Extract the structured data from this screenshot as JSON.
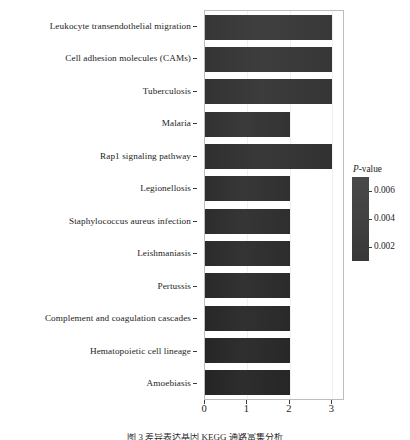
{
  "chart_data": {
    "type": "bar",
    "orientation": "horizontal",
    "title": "",
    "xlabel": "",
    "ylabel": "",
    "xlim": [
      0,
      3.25
    ],
    "xticks": [
      0,
      1,
      2,
      3
    ],
    "xtick_labels": [
      "0",
      "1",
      "2",
      "3"
    ],
    "grid": true,
    "grid_axis": "x",
    "bar_color": "#3e3e3e",
    "categories": [
      "Leukocyte transendothelial migration",
      "Cell adhesion molecules (CAMs)",
      "Tuberculosis",
      "Malaria",
      "Rap1 signaling pathway",
      "Legionellosis",
      "Staphylococcus aureus infection",
      "Leishmaniasis",
      "Pertussis",
      "Complement and coagulation cascades",
      "Hematopoietic cell lineage",
      "Amoebiasis"
    ],
    "values": [
      3,
      3,
      3,
      2,
      3,
      2,
      2,
      2,
      2,
      2,
      2,
      2
    ],
    "legend": {
      "position": "right",
      "title": "P-value",
      "title_italic_prefix": "P",
      "title_rest": "-value",
      "type": "colorbar",
      "ticks": [
        0.006,
        0.004,
        0.002
      ],
      "tick_labels": [
        "0.006",
        "0.004",
        "0.002"
      ],
      "gradient_top_color": "#4a4a4a",
      "gradient_bottom_color": "#383838"
    }
  },
  "caption": {
    "text": "图 3 差异表达基因 KEGG 通路富集分析"
  }
}
